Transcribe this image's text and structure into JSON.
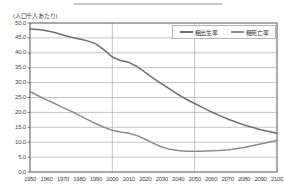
{
  "axis": {
    "y_unit_label": "(人口千人あたり)",
    "y_ticks": [
      "50.0",
      "45.0",
      "40.0",
      "35.0",
      "30.0",
      "25.0",
      "20.0",
      "15.0",
      "10.0",
      "5.0",
      "0.0"
    ],
    "x_ticks": [
      "1950",
      "1960",
      "1970",
      "1980",
      "1990",
      "2000",
      "2010",
      "2020",
      "2030",
      "2040",
      "2050",
      "2060",
      "2070",
      "2080",
      "2090",
      "2100"
    ]
  },
  "legend": {
    "items": [
      {
        "label": "粗出生率",
        "color": "#6e6e6e"
      },
      {
        "label": "粗死亡率",
        "color": "#8c8c8c"
      }
    ]
  },
  "colors": {
    "birth_line": "#6e6e6e",
    "death_line": "#8c8c8c",
    "grid": "#9a9a9a",
    "frame": "#555555",
    "top_rule": "#c8c8c8"
  },
  "chart_data": {
    "type": "line",
    "title": "",
    "xlabel": "",
    "ylabel": "(人口千人あたり)",
    "xlim": [
      1950,
      2100
    ],
    "ylim": [
      0,
      50
    ],
    "grid": true,
    "legend_position": "top-right",
    "x": [
      1950,
      1955,
      1960,
      1965,
      1970,
      1975,
      1980,
      1985,
      1990,
      1995,
      2000,
      2005,
      2010,
      2015,
      2020,
      2025,
      2030,
      2035,
      2040,
      2045,
      2050,
      2055,
      2060,
      2065,
      2070,
      2075,
      2080,
      2085,
      2090,
      2095,
      2100
    ],
    "series": [
      {
        "name": "粗出生率",
        "color": "#6e6e6e",
        "values": [
          48.0,
          47.8,
          47.4,
          46.8,
          46.0,
          45.2,
          44.6,
          44.0,
          43.0,
          41.0,
          38.6,
          37.4,
          36.8,
          35.4,
          33.4,
          31.4,
          29.6,
          27.8,
          26.0,
          24.4,
          23.0,
          21.6,
          20.2,
          19.0,
          17.8,
          16.8,
          15.8,
          15.0,
          14.2,
          13.6,
          13.0
        ]
      },
      {
        "name": "粗死亡率",
        "color": "#8c8c8c",
        "values": [
          27.0,
          25.6,
          24.2,
          23.0,
          21.6,
          20.4,
          19.0,
          17.6,
          16.2,
          15.0,
          14.0,
          13.4,
          13.0,
          12.2,
          11.0,
          9.6,
          8.4,
          7.6,
          7.2,
          7.0,
          7.0,
          7.0,
          7.1,
          7.2,
          7.4,
          7.8,
          8.2,
          8.8,
          9.4,
          10.0,
          10.6
        ]
      }
    ]
  }
}
